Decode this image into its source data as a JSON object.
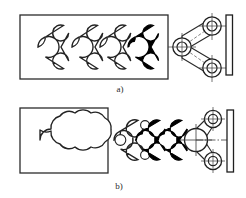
{
  "figure": {
    "type": "engineering-line-drawing",
    "background_color": "#ffffff",
    "line_color": "#1a1a1a",
    "fill_color": "#000000",
    "centerline_color": "#333333"
  },
  "captions": {
    "a": "a)",
    "b": "b)"
  },
  "panels": [
    {
      "id": "a",
      "label": "a)",
      "description": "Discrete successive positions of the ternary link; final position shown solid black",
      "frame": {
        "x": 20,
        "y": 15,
        "width": 148,
        "height": 64
      },
      "links": [
        {
          "name": "link-position-1",
          "filled": false,
          "hub_x": 38,
          "hub_y": 47
        },
        {
          "name": "link-position-2",
          "filled": false,
          "hub_x": 72,
          "hub_y": 47
        },
        {
          "name": "link-position-3",
          "filled": false,
          "hub_x": 104,
          "hub_y": 47
        },
        {
          "name": "link-position-4",
          "filled": true,
          "hub_x": 136,
          "hub_y": 47
        }
      ],
      "fixture": {
        "name": "fixed-frame-bracket",
        "pivot_x": 182,
        "pivot_y": 47,
        "upper_joint_x": 212,
        "upper_joint_y": 26,
        "lower_joint_x": 212,
        "lower_joint_y": 68,
        "wall_x": 231
      }
    },
    {
      "id": "b",
      "label": "b)",
      "description": "Continuous swept envelope (workspace outline) of the same ternary link",
      "frame": {
        "x": 20,
        "y": 108,
        "width": 88,
        "height": 65
      },
      "envelope": {
        "name": "swept-envelope-outline"
      },
      "links": [
        {
          "name": "link-overlay-1",
          "filled": false,
          "hub_x": 128,
          "hub_y": 140
        },
        {
          "name": "link-overlay-2",
          "filled": true,
          "hub_x": 152,
          "hub_y": 140
        },
        {
          "name": "link-overlay-3",
          "filled": true,
          "hub_x": 176,
          "hub_y": 140
        }
      ],
      "fixture": {
        "name": "fixed-frame-bracket",
        "pivot_x": 196,
        "pivot_y": 140,
        "upper_joint_x": 213,
        "upper_joint_y": 119,
        "lower_joint_x": 213,
        "lower_joint_y": 161,
        "wall_x": 232
      }
    }
  ]
}
